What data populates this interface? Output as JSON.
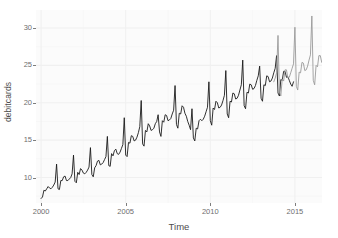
{
  "chart_data": {
    "type": "line",
    "title": "",
    "xlabel": "Time",
    "ylabel": "debitcards",
    "xlim": [
      1999.7,
      2016.6
    ],
    "ylim": [
      6.6,
      32.4
    ],
    "grid": true,
    "legend": false,
    "x_ticks": [
      2000,
      2005,
      2010,
      2015
    ],
    "x_tick_labels": [
      "2000",
      "2005",
      "2010",
      "2015"
    ],
    "y_ticks": [
      10,
      15,
      20,
      25,
      30
    ],
    "y_tick_labels": [
      "10",
      "15",
      "20",
      "25",
      "30"
    ],
    "series": [
      {
        "name": "observed",
        "color": "#1a1a1a",
        "x_start": 2000.0,
        "x_step": 0.0833333,
        "values": [
          7.2,
          7.4,
          8.3,
          8.2,
          8.5,
          8.8,
          8.6,
          8.5,
          8.7,
          9.0,
          9.4,
          11.8,
          8.5,
          8.4,
          9.6,
          9.6,
          10.1,
          10.2,
          9.6,
          9.6,
          9.8,
          10.0,
          10.5,
          13.0,
          9.5,
          9.3,
          10.7,
          10.4,
          11.2,
          11.0,
          10.6,
          10.5,
          10.7,
          11.0,
          11.4,
          14.0,
          10.4,
          10.1,
          11.3,
          11.6,
          12.2,
          12.3,
          11.7,
          11.8,
          12.0,
          12.4,
          12.8,
          15.5,
          11.6,
          11.5,
          13.2,
          12.9,
          13.6,
          13.8,
          13.2,
          13.1,
          13.4,
          13.9,
          14.4,
          18.0,
          13.0,
          12.8,
          14.7,
          14.6,
          15.6,
          15.5,
          14.9,
          15.0,
          15.4,
          16.0,
          16.8,
          20.3,
          14.5,
          14.2,
          16.3,
          16.1,
          17.2,
          16.9,
          16.3,
          16.4,
          16.6,
          17.2,
          17.5,
          18.4,
          16.1,
          15.5,
          17.6,
          17.4,
          18.4,
          18.3,
          17.6,
          17.7,
          17.9,
          18.5,
          19.0,
          22.3,
          17.1,
          16.6,
          18.6,
          18.5,
          19.6,
          19.4,
          18.6,
          18.2,
          17.5,
          17.0,
          16.4,
          19.2,
          15.3,
          14.9,
          16.6,
          16.5,
          17.6,
          17.8,
          17.6,
          17.8,
          18.2,
          18.8,
          19.4,
          22.8,
          17.6,
          17.0,
          19.3,
          19.1,
          20.2,
          20.0,
          19.3,
          19.4,
          19.7,
          20.3,
          21.0,
          24.3,
          18.5,
          18.0,
          20.2,
          20.1,
          21.3,
          21.2,
          20.5,
          20.6,
          21.0,
          21.7,
          22.4,
          25.7,
          19.6,
          19.2,
          21.4,
          21.3,
          22.5,
          22.4,
          21.8,
          21.9,
          22.3,
          23.0,
          23.6,
          24.9,
          20.6,
          20.2,
          22.4,
          22.3,
          23.6,
          23.5,
          22.8,
          22.9,
          23.3,
          24.0,
          24.6,
          26.3,
          21.3,
          20.9,
          23.1,
          23.0,
          24.2,
          24.2,
          23.4,
          23.5,
          23.0,
          22.5,
          22.2,
          22.8
        ]
      },
      {
        "name": "extension",
        "color": "#9a9a9a",
        "x_start": 2013.75,
        "x_step": 0.0833333,
        "values": [
          22.8,
          23.3,
          24.0,
          29.0,
          21.4,
          20.9,
          23.2,
          22.9,
          24.4,
          24.4,
          23.3,
          23.4,
          24.0,
          24.6,
          25.2,
          30.1,
          22.2,
          21.7,
          24.1,
          24.0,
          25.4,
          25.3,
          24.3,
          24.4,
          24.9,
          25.7,
          26.4,
          31.6,
          23.0,
          22.4,
          25.0,
          24.8,
          26.3,
          26.3,
          25.4,
          25.6,
          26.2,
          27.0,
          27.8
        ]
      }
    ]
  },
  "axes": {
    "x_title": "Time",
    "y_title": "debitcards"
  },
  "theme": {
    "panel_background": "#fbfbfb",
    "grid_major_color": "#f0f0f0",
    "grid_minor_color": "#f6f6f6",
    "tick_label_color": "#6e6e6e",
    "axis_title_color": "#4d4d4d",
    "page_background": "#ffffff"
  }
}
